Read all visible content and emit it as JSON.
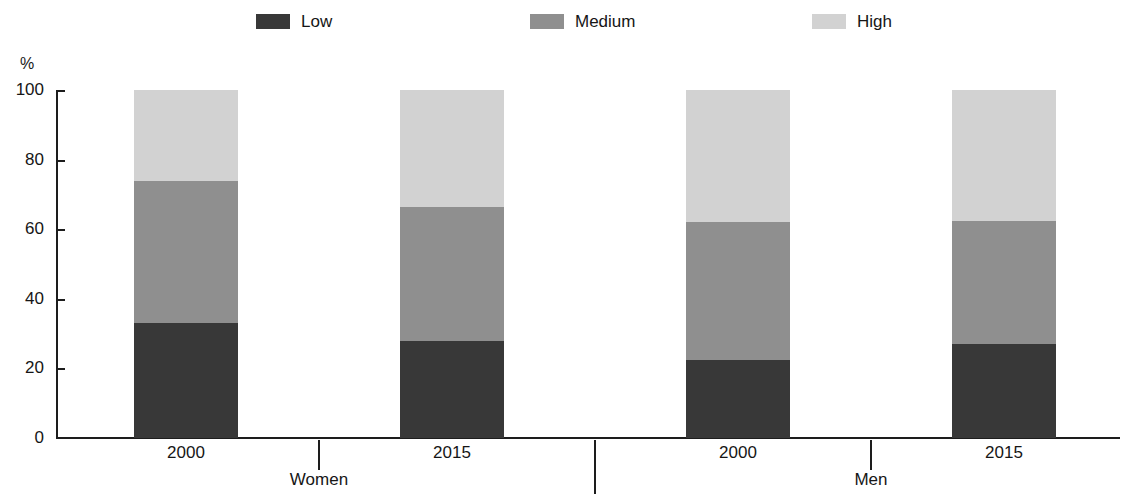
{
  "chart_data": {
    "type": "bar",
    "subtype": "stacked-percentage",
    "title": "",
    "subtitle": "",
    "xlabel": "",
    "ylabel": "%",
    "ylim": [
      0,
      100
    ],
    "y_ticks": [
      100,
      80,
      60,
      40,
      20,
      0
    ],
    "y_tick_labels": [
      "100",
      "80",
      "60",
      "40",
      "20",
      "0"
    ],
    "grid": false,
    "legend_position": "top",
    "categories": [
      "2000",
      "2015",
      "2000",
      "2015"
    ],
    "groups": [
      {
        "label": "Women",
        "categories": [
          "2000",
          "2015"
        ]
      },
      {
        "label": "Men",
        "categories": [
          "2000",
          "2015"
        ]
      }
    ],
    "series": [
      {
        "name": "Low",
        "color": "#383838",
        "values": [
          33.0,
          28.0,
          22.5,
          27.0
        ]
      },
      {
        "name": "Medium",
        "color": "#8f8f8f",
        "values": [
          41.0,
          38.5,
          39.5,
          35.5
        ]
      },
      {
        "name": "High",
        "color": "#d2d2d2",
        "values": [
          26.0,
          33.5,
          38.0,
          37.5
        ]
      }
    ],
    "bars": [
      {
        "group": "Women",
        "category": "2000",
        "low": 33.0,
        "medium": 41.0,
        "high": 26.0
      },
      {
        "group": "Women",
        "category": "2015",
        "low": 28.0,
        "medium": 38.5,
        "high": 33.5
      },
      {
        "group": "Men",
        "category": "2000",
        "low": 22.5,
        "medium": 39.5,
        "high": 38.0
      },
      {
        "group": "Men",
        "category": "2015",
        "low": 27.0,
        "medium": 35.5,
        "high": 37.5
      }
    ]
  },
  "legend": {
    "items": [
      {
        "label": "Low",
        "color": "#383838"
      },
      {
        "label": "Medium",
        "color": "#8f8f8f"
      },
      {
        "label": "High",
        "color": "#d2d2d2"
      }
    ]
  },
  "axis": {
    "y_unit": "%",
    "y_tick_labels": [
      "100",
      "80",
      "60",
      "40",
      "20",
      "0"
    ]
  },
  "x_axis": {
    "category_labels": [
      "2000",
      "2015",
      "2000",
      "2015"
    ],
    "group_labels": [
      "Women",
      "Men"
    ]
  }
}
